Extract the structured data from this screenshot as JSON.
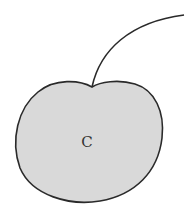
{
  "diagram": {
    "shape": "cherry",
    "label": "C",
    "colors": {
      "fill": "#d9d9d9",
      "stroke": "#2a2a2a",
      "background": "#ffffff"
    }
  }
}
